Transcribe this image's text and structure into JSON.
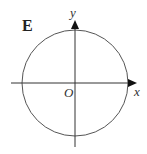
{
  "panel": {
    "label": "E"
  },
  "axes": {
    "x_label": "x",
    "y_label": "y",
    "origin_label": "O"
  },
  "figure": {
    "shape": "circle",
    "center": [
      75,
      83
    ],
    "radius": 53,
    "stroke_color": "#555555",
    "axis_color": "#333333"
  }
}
